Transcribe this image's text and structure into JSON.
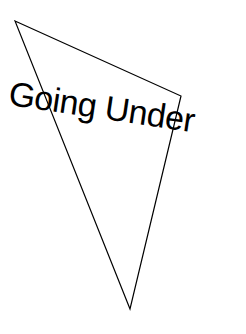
{
  "title": "Going Under",
  "shape": {
    "type": "triangle",
    "points": [
      [
        15,
        21
      ],
      [
        181,
        96
      ],
      [
        130,
        309
      ]
    ],
    "stroke": "#000000"
  }
}
